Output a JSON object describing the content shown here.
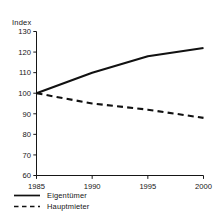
{
  "chart_data": {
    "type": "line",
    "title": "",
    "subtitle": "",
    "xlabel": "",
    "ylabel": "Index",
    "ylim": [
      60,
      130
    ],
    "xlim": [
      1985,
      2000
    ],
    "grid": false,
    "legend_position": "bottom-left",
    "yticks": [
      130,
      120,
      110,
      100,
      90,
      80,
      70,
      60
    ],
    "xticks": [
      1985,
      1990,
      1995,
      2000
    ],
    "x": [
      1985,
      1990,
      1995,
      2000
    ],
    "series": [
      {
        "name": "Eigentümer",
        "style": "solid",
        "color": "#111111",
        "values": [
          100,
          110,
          118,
          122
        ]
      },
      {
        "name": "Hauptmieter",
        "style": "dashed",
        "color": "#111111",
        "values": [
          100,
          95,
          92,
          88
        ]
      }
    ]
  },
  "legend": {
    "items": [
      {
        "label": "Eigentümer",
        "style": "solid"
      },
      {
        "label": "Hauptmieter",
        "style": "dashed"
      }
    ]
  }
}
